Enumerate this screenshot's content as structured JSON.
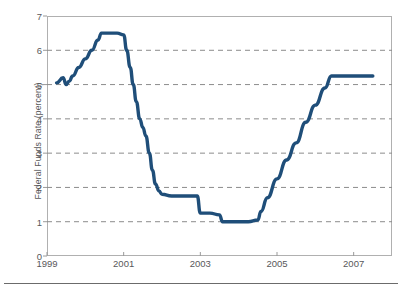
{
  "chart_data": {
    "type": "line",
    "title": "",
    "subtitle": "",
    "xlabel": "",
    "ylabel": "Federal Funds Rate (percent)",
    "xlim": [
      1999,
      2008
    ],
    "ylim": [
      0,
      7
    ],
    "ytick_labels": [
      "0",
      "1",
      "2",
      "3",
      "4",
      "5",
      "6",
      "7"
    ],
    "ytick_values": [
      0,
      1,
      2,
      3,
      4,
      5,
      6,
      7
    ],
    "xtick_labels": [
      "1999",
      "2001",
      "2003",
      "2005",
      "2007"
    ],
    "xtick_values": [
      1999,
      2001,
      2003,
      2005,
      2007
    ],
    "grid": "horizontal-dashed",
    "legend": "none",
    "line_color": "#1f4e79",
    "line_width_px": 3.4,
    "series": [
      {
        "name": "Federal Funds Rate",
        "x": [
          1999.25,
          1999.42,
          1999.5,
          1999.58,
          1999.67,
          1999.83,
          2000.0,
          2000.17,
          2000.33,
          2000.42,
          2000.58,
          2000.83,
          2001.0,
          2001.08,
          2001.17,
          2001.25,
          2001.33,
          2001.42,
          2001.5,
          2001.58,
          2001.67,
          2001.75,
          2001.83,
          2001.92,
          2002.0,
          2002.25,
          2002.5,
          2002.75,
          2002.92,
          2003.0,
          2003.25,
          2003.5,
          2003.58,
          2003.75,
          2004.0,
          2004.25,
          2004.5,
          2004.58,
          2004.75,
          2005.0,
          2005.25,
          2005.5,
          2005.75,
          2006.0,
          2006.25,
          2006.42,
          2006.5,
          2006.75,
          2007.0,
          2007.25,
          2007.5
        ],
        "y": [
          5.05,
          5.2,
          5.0,
          5.1,
          5.25,
          5.5,
          5.75,
          6.0,
          6.3,
          6.5,
          6.5,
          6.5,
          6.45,
          6.0,
          5.5,
          5.0,
          4.5,
          4.0,
          3.75,
          3.5,
          3.0,
          2.5,
          2.1,
          1.9,
          1.8,
          1.75,
          1.75,
          1.75,
          1.75,
          1.25,
          1.25,
          1.2,
          1.0,
          1.0,
          1.0,
          1.0,
          1.05,
          1.3,
          1.7,
          2.25,
          2.8,
          3.3,
          3.9,
          4.4,
          4.9,
          5.25,
          5.25,
          5.25,
          5.25,
          5.25,
          5.25
        ]
      }
    ]
  }
}
